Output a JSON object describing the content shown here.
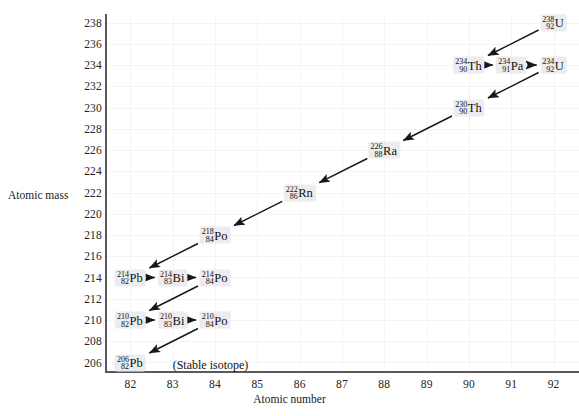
{
  "chart_data": {
    "type": "scatter",
    "title": "",
    "xlabel": "Atomic number",
    "ylabel": "Atomic mass",
    "xlim": [
      81.4,
      92.6
    ],
    "ylim": [
      205.2,
      238.8
    ],
    "xticks": [
      82,
      83,
      84,
      85,
      86,
      87,
      88,
      89,
      90,
      91,
      92
    ],
    "yticks": [
      206,
      208,
      210,
      212,
      214,
      216,
      218,
      220,
      222,
      224,
      226,
      228,
      230,
      232,
      234,
      236,
      238
    ],
    "grid": true,
    "legend": null,
    "annotations": [
      {
        "text": "(Stable isotope)",
        "x": 83.0,
        "y": 205.8
      }
    ],
    "nodes": [
      {
        "id": "U238",
        "symbol": "U",
        "mass": "238",
        "number": "92",
        "x": 92,
        "y": 238
      },
      {
        "id": "Th234",
        "symbol": "Th",
        "mass": "234",
        "number": "90",
        "x": 90,
        "y": 234
      },
      {
        "id": "Pa234",
        "symbol": "Pa",
        "mass": "234",
        "number": "91",
        "x": 91,
        "y": 234
      },
      {
        "id": "U234",
        "symbol": "U",
        "mass": "234",
        "number": "92",
        "x": 92,
        "y": 234
      },
      {
        "id": "Th230",
        "symbol": "Th",
        "mass": "230",
        "number": "90",
        "x": 90,
        "y": 230
      },
      {
        "id": "Ra226",
        "symbol": "Ra",
        "mass": "226",
        "number": "88",
        "x": 88,
        "y": 226
      },
      {
        "id": "Rn222",
        "symbol": "Rn",
        "mass": "222",
        "number": "86",
        "x": 86,
        "y": 222
      },
      {
        "id": "Po218",
        "symbol": "Po",
        "mass": "218",
        "number": "84",
        "x": 84,
        "y": 218
      },
      {
        "id": "Pb214",
        "symbol": "Pb",
        "mass": "214",
        "number": "82",
        "x": 82,
        "y": 214
      },
      {
        "id": "Bi214",
        "symbol": "Bi",
        "mass": "214",
        "number": "83",
        "x": 83,
        "y": 214
      },
      {
        "id": "Po214",
        "symbol": "Po",
        "mass": "214",
        "number": "84",
        "x": 84,
        "y": 214
      },
      {
        "id": "Pb210",
        "symbol": "Pb",
        "mass": "210",
        "number": "82",
        "x": 82,
        "y": 210
      },
      {
        "id": "Bi210",
        "symbol": "Bi",
        "mass": "210",
        "number": "83",
        "x": 83,
        "y": 210
      },
      {
        "id": "Po210",
        "symbol": "Po",
        "mass": "210",
        "number": "84",
        "x": 84,
        "y": 210
      },
      {
        "id": "Pb206",
        "symbol": "Pb",
        "mass": "206",
        "number": "82",
        "x": 82,
        "y": 206
      }
    ],
    "edges": [
      {
        "from": "U238",
        "to": "Th234",
        "kind": "alpha"
      },
      {
        "from": "Th234",
        "to": "Pa234",
        "kind": "beta"
      },
      {
        "from": "Pa234",
        "to": "U234",
        "kind": "beta"
      },
      {
        "from": "U234",
        "to": "Th230",
        "kind": "alpha"
      },
      {
        "from": "Th230",
        "to": "Ra226",
        "kind": "alpha"
      },
      {
        "from": "Ra226",
        "to": "Rn222",
        "kind": "alpha"
      },
      {
        "from": "Rn222",
        "to": "Po218",
        "kind": "alpha"
      },
      {
        "from": "Po218",
        "to": "Pb214",
        "kind": "alpha"
      },
      {
        "from": "Pb214",
        "to": "Bi214",
        "kind": "beta"
      },
      {
        "from": "Bi214",
        "to": "Po214",
        "kind": "beta"
      },
      {
        "from": "Po214",
        "to": "Pb210",
        "kind": "alpha"
      },
      {
        "from": "Pb210",
        "to": "Bi210",
        "kind": "beta"
      },
      {
        "from": "Bi210",
        "to": "Po210",
        "kind": "beta"
      },
      {
        "from": "Po210",
        "to": "Pb206",
        "kind": "alpha"
      }
    ]
  }
}
